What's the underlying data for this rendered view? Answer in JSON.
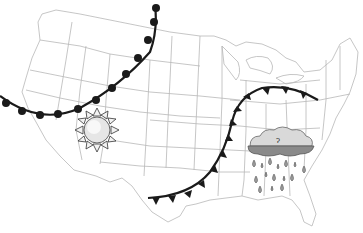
{
  "map": {
    "region": "Contiguous United States",
    "colors": {
      "background": "#ffffff",
      "state_border": "#b8b8b8",
      "front_line": "#1a1a1a",
      "sun_fill": "#e6e6e6",
      "cloud_light": "#d9d9d9",
      "cloud_dark": "#8a8a8a",
      "raindrop": "#9a9a9a"
    },
    "symbols": [
      {
        "type": "stationary-front-arc",
        "description": "Curved front line with semicircle markers across the northwest"
      },
      {
        "type": "cold-front",
        "description": "Front line with triangle markers from Texas curving northeast to the Great Lakes"
      },
      {
        "type": "sun-icon",
        "location": "Utah/Colorado"
      },
      {
        "type": "rain-cloud-icon",
        "location": "Southeast (Tennessee/Georgia)"
      }
    ]
  }
}
